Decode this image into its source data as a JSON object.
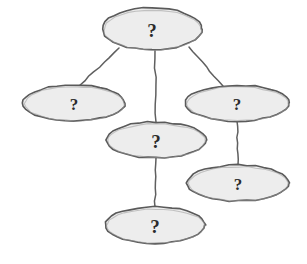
{
  "diagram": {
    "type": "node-link-diagram",
    "style": "hand-drawn",
    "background_color": "#ffffff",
    "node_fill_color": "#ededed",
    "node_stroke_color": "#5a5a5a",
    "edge_color": "#5f5f5f",
    "label_color": "#2b2b2b",
    "nodes": [
      {
        "id": "node-root",
        "name": "root-node",
        "label": "?",
        "cx": 152,
        "cy": 29,
        "rx": 50,
        "ry": 21,
        "label_size": "large"
      },
      {
        "id": "node-left",
        "name": "left-node",
        "label": "?",
        "cx": 74,
        "cy": 103,
        "rx": 51,
        "ry": 18,
        "label_size": "small"
      },
      {
        "id": "node-right",
        "name": "right-node",
        "label": "?",
        "cx": 237,
        "cy": 103,
        "rx": 52,
        "ry": 18,
        "label_size": "small"
      },
      {
        "id": "node-middle",
        "name": "middle-node",
        "label": "?",
        "cx": 156,
        "cy": 140,
        "rx": 50,
        "ry": 18,
        "label_size": "large"
      },
      {
        "id": "node-lower-right",
        "name": "lower-right-node",
        "label": "?",
        "cx": 238,
        "cy": 183,
        "rx": 51,
        "ry": 18,
        "label_size": "small"
      },
      {
        "id": "node-bottom",
        "name": "bottom-node",
        "label": "?",
        "cx": 155,
        "cy": 225,
        "rx": 50,
        "ry": 18,
        "label_size": "large"
      }
    ],
    "edges": [
      {
        "id": "edge-root-left",
        "name": "edge-root-to-left",
        "from": "node-root",
        "to": "node-left",
        "x1": 119,
        "y1": 48,
        "x2": 79,
        "y2": 86
      },
      {
        "id": "edge-root-middle",
        "name": "edge-root-to-middle",
        "from": "node-root",
        "to": "node-middle",
        "x1": 155,
        "y1": 50,
        "x2": 156,
        "y2": 122
      },
      {
        "id": "edge-root-right",
        "name": "edge-root-to-right",
        "from": "node-root",
        "to": "node-right",
        "x1": 189,
        "y1": 47,
        "x2": 223,
        "y2": 86
      },
      {
        "id": "edge-right-lowerright",
        "name": "edge-right-to-lower-right",
        "from": "node-right",
        "to": "node-lower-right",
        "x1": 237,
        "y1": 121,
        "x2": 238,
        "y2": 165
      },
      {
        "id": "edge-middle-bottom",
        "name": "edge-middle-to-bottom",
        "from": "node-middle",
        "to": "node-bottom",
        "x1": 156,
        "y1": 158,
        "x2": 155,
        "y2": 207
      }
    ]
  }
}
